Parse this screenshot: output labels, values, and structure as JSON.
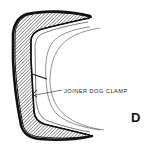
{
  "diagram": {
    "callout_label": "JOINER DOG CLAMP",
    "figure_letter": "D",
    "colors": {
      "ink": "#111111",
      "background": "#ffffff"
    }
  }
}
